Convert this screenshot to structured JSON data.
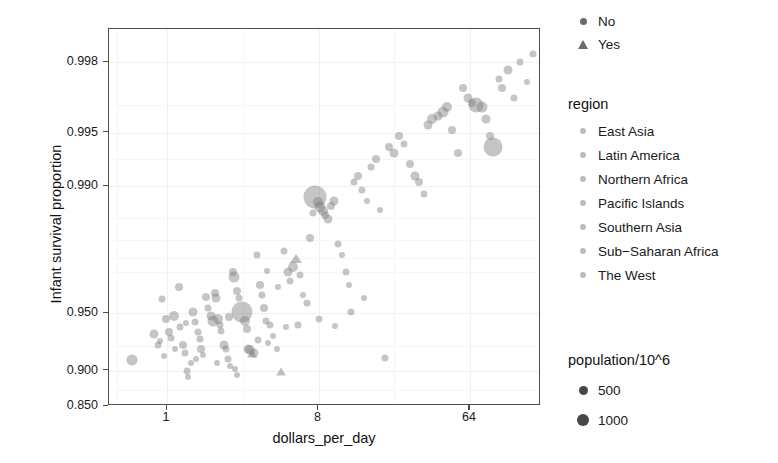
{
  "chart_data": {
    "type": "scatter",
    "title": "",
    "xlabel": "dollars_per_day",
    "ylabel": "Infant survival proportion",
    "x_scale": "log2",
    "x_ticks": [
      {
        "label": "1",
        "value": 1
      },
      {
        "label": "8",
        "value": 8
      },
      {
        "label": "64",
        "value": 64
      }
    ],
    "y_scale": "logit",
    "y_ticks": [
      {
        "label": "0.998",
        "value": 0.998
      },
      {
        "label": "0.995",
        "value": 0.995
      },
      {
        "label": "0.990",
        "value": 0.99
      },
      {
        "label": "0.950",
        "value": 0.95
      },
      {
        "label": "0.900",
        "value": 0.9
      },
      {
        "label": "0.850",
        "value": 0.85
      }
    ],
    "xlim": [
      0.45,
      170
    ],
    "ylim": [
      0.85,
      0.9987
    ],
    "grid": true,
    "legend_position": "right",
    "point_color": "#7f7f7f",
    "point_opacity": 0.45,
    "points": [
      {
        "x": 0.62,
        "y": 0.9115,
        "r": 5.5,
        "shape": "circle"
      },
      {
        "x": 0.83,
        "y": 0.9355,
        "r": 4.5,
        "shape": "circle"
      },
      {
        "x": 0.88,
        "y": 0.9265,
        "r": 3.5,
        "shape": "circle"
      },
      {
        "x": 0.9,
        "y": 0.9295,
        "r": 3.0,
        "shape": "circle"
      },
      {
        "x": 0.93,
        "y": 0.958,
        "r": 3.5,
        "shape": "circle"
      },
      {
        "x": 0.99,
        "y": 0.9465,
        "r": 4.0,
        "shape": "circle"
      },
      {
        "x": 1.02,
        "y": 0.937,
        "r": 4.0,
        "shape": "circle"
      },
      {
        "x": 1.06,
        "y": 0.932,
        "r": 3.5,
        "shape": "circle"
      },
      {
        "x": 1.1,
        "y": 0.9485,
        "r": 5.0,
        "shape": "circle"
      },
      {
        "x": 1.12,
        "y": 0.9222,
        "r": 3.0,
        "shape": "circle"
      },
      {
        "x": 1.17,
        "y": 0.964,
        "r": 4.0,
        "shape": "circle"
      },
      {
        "x": 1.2,
        "y": 0.941,
        "r": 3.5,
        "shape": "circle"
      },
      {
        "x": 1.24,
        "y": 0.9265,
        "r": 4.0,
        "shape": "circle"
      },
      {
        "x": 1.27,
        "y": 0.9185,
        "r": 3.5,
        "shape": "circle"
      },
      {
        "x": 1.31,
        "y": 0.8995,
        "r": 3.5,
        "shape": "circle"
      },
      {
        "x": 1.34,
        "y": 0.8925,
        "r": 3.0,
        "shape": "circle"
      },
      {
        "x": 1.38,
        "y": 0.908,
        "r": 3.0,
        "shape": "circle"
      },
      {
        "x": 1.42,
        "y": 0.951,
        "r": 4.5,
        "shape": "circle"
      },
      {
        "x": 1.46,
        "y": 0.944,
        "r": 3.5,
        "shape": "circle"
      },
      {
        "x": 1.52,
        "y": 0.9372,
        "r": 3.5,
        "shape": "circle"
      },
      {
        "x": 1.56,
        "y": 0.931,
        "r": 3.5,
        "shape": "circle"
      },
      {
        "x": 1.6,
        "y": 0.9222,
        "r": 4.0,
        "shape": "circle"
      },
      {
        "x": 1.64,
        "y": 0.9168,
        "r": 3.0,
        "shape": "circle"
      },
      {
        "x": 1.7,
        "y": 0.959,
        "r": 4.0,
        "shape": "circle"
      },
      {
        "x": 1.75,
        "y": 0.953,
        "r": 3.5,
        "shape": "circle"
      },
      {
        "x": 1.82,
        "y": 0.948,
        "r": 4.5,
        "shape": "circle"
      },
      {
        "x": 1.88,
        "y": 0.9452,
        "r": 5.5,
        "shape": "circle"
      },
      {
        "x": 1.92,
        "y": 0.9612,
        "r": 4.0,
        "shape": "circle"
      },
      {
        "x": 1.96,
        "y": 0.9585,
        "r": 4.5,
        "shape": "circle"
      },
      {
        "x": 2.02,
        "y": 0.946,
        "r": 5.0,
        "shape": "circle"
      },
      {
        "x": 2.06,
        "y": 0.942,
        "r": 3.5,
        "shape": "circle"
      },
      {
        "x": 2.1,
        "y": 0.9375,
        "r": 3.5,
        "shape": "circle"
      },
      {
        "x": 2.18,
        "y": 0.9262,
        "r": 4.5,
        "shape": "circle"
      },
      {
        "x": 2.24,
        "y": 0.9228,
        "r": 3.5,
        "shape": "circle"
      },
      {
        "x": 2.3,
        "y": 0.9125,
        "r": 3.5,
        "shape": "circle"
      },
      {
        "x": 2.38,
        "y": 0.9055,
        "r": 3.0,
        "shape": "circle"
      },
      {
        "x": 2.46,
        "y": 0.97,
        "r": 4.0,
        "shape": "circle"
      },
      {
        "x": 2.52,
        "y": 0.968,
        "r": 5.5,
        "shape": "circle"
      },
      {
        "x": 2.6,
        "y": 0.962,
        "r": 4.0,
        "shape": "circle"
      },
      {
        "x": 2.7,
        "y": 0.9588,
        "r": 3.5,
        "shape": "circle"
      },
      {
        "x": 2.8,
        "y": 0.9505,
        "r": 10.5,
        "shape": "circle"
      },
      {
        "x": 2.9,
        "y": 0.9452,
        "r": 5.0,
        "shape": "circle"
      },
      {
        "x": 2.98,
        "y": 0.939,
        "r": 4.0,
        "shape": "circle"
      },
      {
        "x": 3.05,
        "y": 0.923,
        "r": 4.5,
        "shape": "circle"
      },
      {
        "x": 3.12,
        "y": 0.9215,
        "r": 5.0,
        "shape": "circle"
      },
      {
        "x": 3.22,
        "y": 0.9175,
        "r": 4.0,
        "shape": "triangle"
      },
      {
        "x": 3.3,
        "y": 0.919,
        "r": 4.5,
        "shape": "circle"
      },
      {
        "x": 3.42,
        "y": 0.976,
        "r": 3.5,
        "shape": "circle"
      },
      {
        "x": 3.56,
        "y": 0.9648,
        "r": 4.0,
        "shape": "circle"
      },
      {
        "x": 3.66,
        "y": 0.96,
        "r": 3.5,
        "shape": "circle"
      },
      {
        "x": 3.78,
        "y": 0.953,
        "r": 4.0,
        "shape": "circle"
      },
      {
        "x": 3.9,
        "y": 0.9452,
        "r": 3.5,
        "shape": "circle"
      },
      {
        "x": 4.1,
        "y": 0.942,
        "r": 3.5,
        "shape": "circle"
      },
      {
        "x": 4.3,
        "y": 0.934,
        "r": 3.0,
        "shape": "circle"
      },
      {
        "x": 4.55,
        "y": 0.923,
        "r": 3.0,
        "shape": "circle"
      },
      {
        "x": 4.8,
        "y": 0.8985,
        "r": 4.0,
        "shape": "triangle"
      },
      {
        "x": 5.0,
        "y": 0.977,
        "r": 3.5,
        "shape": "circle"
      },
      {
        "x": 5.25,
        "y": 0.9702,
        "r": 4.5,
        "shape": "circle"
      },
      {
        "x": 5.4,
        "y": 0.9665,
        "r": 3.5,
        "shape": "circle"
      },
      {
        "x": 5.6,
        "y": 0.972,
        "r": 5.0,
        "shape": "circle"
      },
      {
        "x": 5.9,
        "y": 0.9745,
        "r": 4.5,
        "shape": "triangle"
      },
      {
        "x": 6.2,
        "y": 0.969,
        "r": 3.5,
        "shape": "circle"
      },
      {
        "x": 6.5,
        "y": 0.96,
        "r": 3.0,
        "shape": "circle"
      },
      {
        "x": 6.8,
        "y": 0.956,
        "r": 3.5,
        "shape": "circle"
      },
      {
        "x": 7.1,
        "y": 0.9805,
        "r": 4.0,
        "shape": "circle"
      },
      {
        "x": 7.4,
        "y": 0.986,
        "r": 3.5,
        "shape": "circle"
      },
      {
        "x": 7.6,
        "y": 0.9885,
        "r": 11.5,
        "shape": "circle"
      },
      {
        "x": 7.9,
        "y": 0.9878,
        "r": 5.0,
        "shape": "circle"
      },
      {
        "x": 8.2,
        "y": 0.987,
        "r": 5.5,
        "shape": "circle"
      },
      {
        "x": 8.5,
        "y": 0.9862,
        "r": 5.0,
        "shape": "circle"
      },
      {
        "x": 8.8,
        "y": 0.9855,
        "r": 4.0,
        "shape": "circle"
      },
      {
        "x": 9.1,
        "y": 0.9848,
        "r": 4.5,
        "shape": "circle"
      },
      {
        "x": 9.5,
        "y": 0.9872,
        "r": 4.0,
        "shape": "circle"
      },
      {
        "x": 9.9,
        "y": 0.988,
        "r": 4.5,
        "shape": "circle"
      },
      {
        "x": 10.5,
        "y": 0.979,
        "r": 3.5,
        "shape": "circle"
      },
      {
        "x": 11.0,
        "y": 0.976,
        "r": 3.0,
        "shape": "circle"
      },
      {
        "x": 11.6,
        "y": 0.97,
        "r": 3.5,
        "shape": "circle"
      },
      {
        "x": 12.2,
        "y": 0.965,
        "r": 3.0,
        "shape": "circle"
      },
      {
        "x": 13.0,
        "y": 0.9905,
        "r": 3.5,
        "shape": "circle"
      },
      {
        "x": 13.8,
        "y": 0.9912,
        "r": 4.0,
        "shape": "circle"
      },
      {
        "x": 14.5,
        "y": 0.9895,
        "r": 3.5,
        "shape": "circle"
      },
      {
        "x": 15.5,
        "y": 0.988,
        "r": 3.0,
        "shape": "circle"
      },
      {
        "x": 16.5,
        "y": 0.9922,
        "r": 3.5,
        "shape": "circle"
      },
      {
        "x": 17.5,
        "y": 0.993,
        "r": 4.0,
        "shape": "circle"
      },
      {
        "x": 18.5,
        "y": 0.9865,
        "r": 3.0,
        "shape": "circle"
      },
      {
        "x": 20.0,
        "y": 0.914,
        "r": 3.5,
        "shape": "circle"
      },
      {
        "x": 21.0,
        "y": 0.994,
        "r": 4.0,
        "shape": "circle"
      },
      {
        "x": 22.5,
        "y": 0.9935,
        "r": 4.5,
        "shape": "circle"
      },
      {
        "x": 24.0,
        "y": 0.9948,
        "r": 4.0,
        "shape": "circle"
      },
      {
        "x": 26.0,
        "y": 0.9942,
        "r": 3.5,
        "shape": "circle"
      },
      {
        "x": 28.0,
        "y": 0.9925,
        "r": 4.0,
        "shape": "circle"
      },
      {
        "x": 30.0,
        "y": 0.9912,
        "r": 4.5,
        "shape": "circle"
      },
      {
        "x": 32.0,
        "y": 0.9905,
        "r": 4.0,
        "shape": "circle"
      },
      {
        "x": 34.0,
        "y": 0.989,
        "r": 3.5,
        "shape": "circle"
      },
      {
        "x": 36.0,
        "y": 0.9955,
        "r": 4.5,
        "shape": "circle"
      },
      {
        "x": 38.0,
        "y": 0.9958,
        "r": 5.0,
        "shape": "circle"
      },
      {
        "x": 41.0,
        "y": 0.996,
        "r": 4.5,
        "shape": "circle"
      },
      {
        "x": 44.0,
        "y": 0.9962,
        "r": 5.5,
        "shape": "circle"
      },
      {
        "x": 47.0,
        "y": 0.9964,
        "r": 5.0,
        "shape": "circle"
      },
      {
        "x": 50.0,
        "y": 0.9952,
        "r": 4.0,
        "shape": "circle"
      },
      {
        "x": 54.0,
        "y": 0.9935,
        "r": 4.0,
        "shape": "circle"
      },
      {
        "x": 58.0,
        "y": 0.9972,
        "r": 4.0,
        "shape": "circle"
      },
      {
        "x": 62.0,
        "y": 0.9968,
        "r": 4.5,
        "shape": "circle"
      },
      {
        "x": 66.0,
        "y": 0.9966,
        "r": 4.0,
        "shape": "circle"
      },
      {
        "x": 70.0,
        "y": 0.9965,
        "r": 7.5,
        "shape": "circle"
      },
      {
        "x": 76.0,
        "y": 0.9964,
        "r": 5.5,
        "shape": "circle"
      },
      {
        "x": 80.0,
        "y": 0.9958,
        "r": 4.5,
        "shape": "circle"
      },
      {
        "x": 84.0,
        "y": 0.9948,
        "r": 4.0,
        "shape": "circle"
      },
      {
        "x": 88.0,
        "y": 0.994,
        "r": 9.5,
        "shape": "circle"
      },
      {
        "x": 95.0,
        "y": 0.9975,
        "r": 3.5,
        "shape": "circle"
      },
      {
        "x": 100.0,
        "y": 0.9972,
        "r": 4.0,
        "shape": "circle"
      },
      {
        "x": 108.0,
        "y": 0.9978,
        "r": 4.5,
        "shape": "circle"
      },
      {
        "x": 118.0,
        "y": 0.9968,
        "r": 3.5,
        "shape": "circle"
      },
      {
        "x": 128.0,
        "y": 0.998,
        "r": 3.5,
        "shape": "circle"
      },
      {
        "x": 140.0,
        "y": 0.9974,
        "r": 3.0,
        "shape": "circle"
      },
      {
        "x": 152.0,
        "y": 0.9982,
        "r": 3.5,
        "shape": "circle"
      },
      {
        "x": 1.48,
        "y": 0.9132,
        "r": 3.0,
        "shape": "circle"
      },
      {
        "x": 1.98,
        "y": 0.9082,
        "r": 3.0,
        "shape": "circle"
      },
      {
        "x": 2.55,
        "y": 0.9012,
        "r": 3.0,
        "shape": "circle"
      },
      {
        "x": 2.62,
        "y": 0.8945,
        "r": 3.0,
        "shape": "circle"
      },
      {
        "x": 3.5,
        "y": 0.9308,
        "r": 3.5,
        "shape": "circle"
      },
      {
        "x": 4.0,
        "y": 0.9282,
        "r": 3.0,
        "shape": "circle"
      },
      {
        "x": 2.34,
        "y": 0.9478,
        "r": 4.0,
        "shape": "circle"
      },
      {
        "x": 1.3,
        "y": 0.9432,
        "r": 3.0,
        "shape": "circle"
      },
      {
        "x": 0.96,
        "y": 0.9162,
        "r": 3.0,
        "shape": "circle"
      },
      {
        "x": 6.0,
        "y": 0.942,
        "r": 3.5,
        "shape": "circle"
      },
      {
        "x": 8.0,
        "y": 0.9462,
        "r": 3.5,
        "shape": "circle"
      },
      {
        "x": 10.0,
        "y": 0.9412,
        "r": 3.0,
        "shape": "circle"
      },
      {
        "x": 12.5,
        "y": 0.951,
        "r": 3.5,
        "shape": "circle"
      },
      {
        "x": 15.0,
        "y": 0.9588,
        "r": 3.0,
        "shape": "circle"
      },
      {
        "x": 5.1,
        "y": 0.9405,
        "r": 3.0,
        "shape": "circle"
      },
      {
        "x": 4.6,
        "y": 0.964,
        "r": 3.0,
        "shape": "circle"
      },
      {
        "x": 3.95,
        "y": 0.9705,
        "r": 3.0,
        "shape": "circle"
      }
    ]
  },
  "axes": {
    "x_title": "dollars_per_day",
    "y_title": "Infant survival proportion"
  },
  "shape_legend": {
    "title": "",
    "items": [
      {
        "label": "No",
        "marker": "circle"
      },
      {
        "label": "Yes",
        "marker": "triangle"
      }
    ]
  },
  "region_legend": {
    "title": "region",
    "items": [
      {
        "label": "East Asia"
      },
      {
        "label": "Latin America"
      },
      {
        "label": "Northern Africa"
      },
      {
        "label": "Pacific Islands"
      },
      {
        "label": "Southern Asia"
      },
      {
        "label": "Sub−Saharan Africa"
      },
      {
        "label": "The West"
      }
    ]
  },
  "size_legend": {
    "title": "population/10^6",
    "items": [
      {
        "label": "500",
        "size": 9
      },
      {
        "label": "1000",
        "size": 12
      }
    ]
  }
}
